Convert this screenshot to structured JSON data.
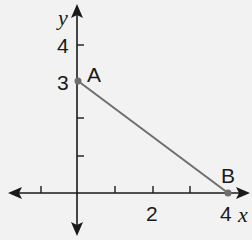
{
  "axes": {
    "x_label": "x",
    "y_label": "y",
    "x_tick_labels": [
      {
        "value": 2,
        "text": "2"
      },
      {
        "value": 4,
        "text": "4"
      }
    ],
    "y_tick_labels": [
      {
        "value": 3,
        "text": "3"
      },
      {
        "value": 4,
        "text": "4"
      }
    ],
    "x_ticks": [
      -1,
      1,
      2,
      3,
      4
    ],
    "y_ticks": [
      1,
      2,
      3,
      4
    ]
  },
  "points": [
    {
      "name": "A",
      "x": 0,
      "y": 3
    },
    {
      "name": "B",
      "x": 4,
      "y": 0
    }
  ],
  "segment": {
    "from": "A",
    "to": "B",
    "color": "#6e6e6e"
  },
  "colors": {
    "axis": "#1a1a1a",
    "segment": "#6e6e6e",
    "point": "#6e6e6e",
    "background": "#f2f2f2"
  }
}
